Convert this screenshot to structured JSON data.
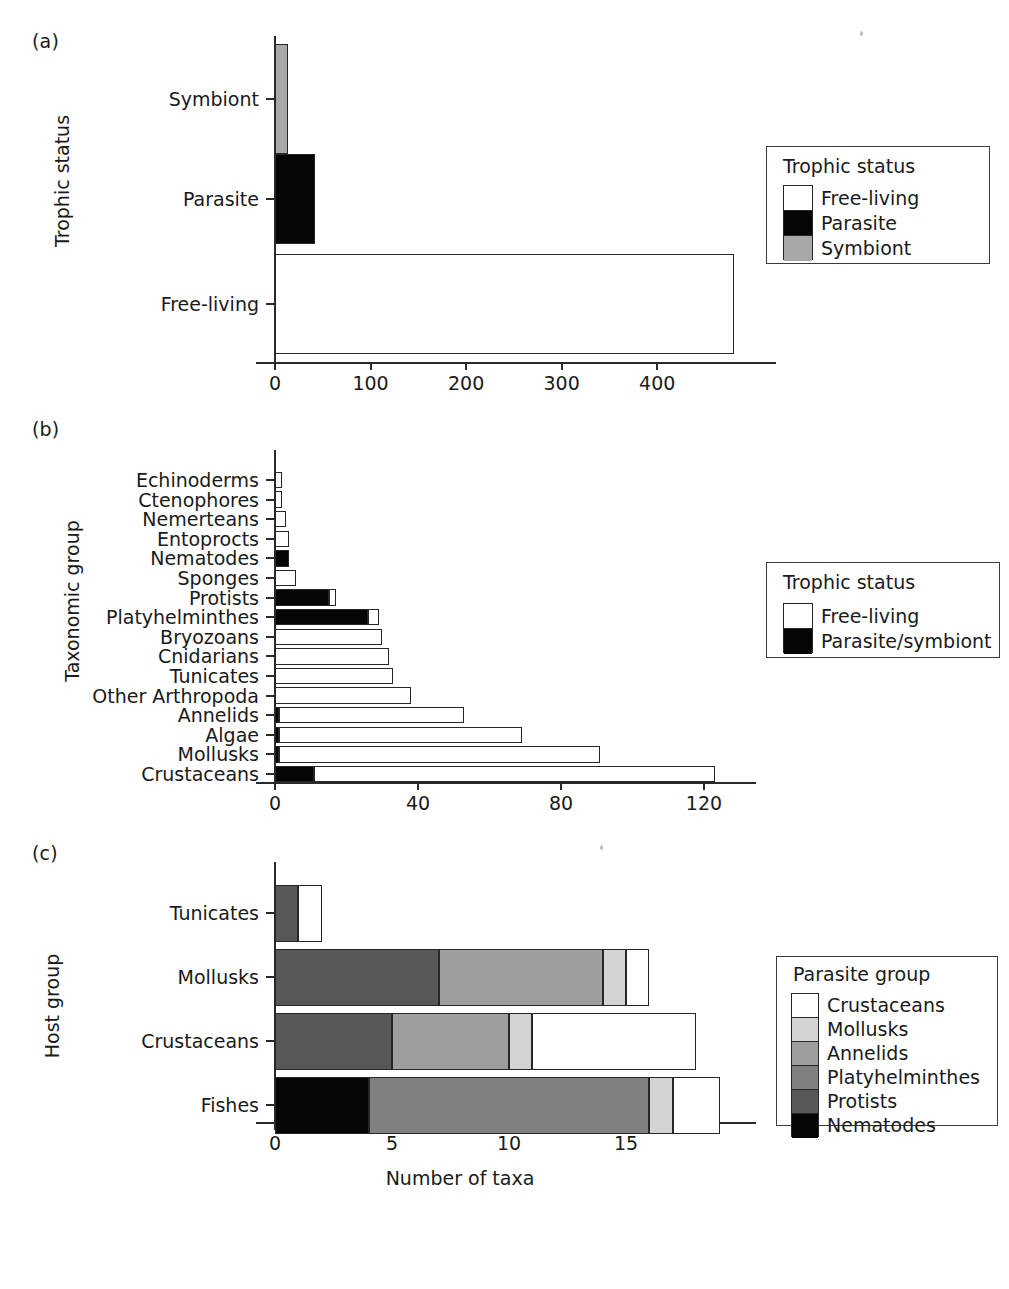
{
  "figure": {
    "panels": [
      {
        "tag": "(a)",
        "ylabel": "Trophic status",
        "xlabel": "",
        "legend": {
          "title": "Trophic status",
          "entries": [
            {
              "label": "Free-living",
              "color": "#ffffff"
            },
            {
              "label": "Parasite",
              "color": "#050505"
            },
            {
              "label": "Symbiont",
              "color": "#a8a8a8"
            }
          ]
        }
      },
      {
        "tag": "(b)",
        "ylabel": "Taxonomic group",
        "xlabel": "",
        "legend": {
          "title": "Trophic status",
          "entries": [
            {
              "label": "Free-living",
              "color": "#ffffff"
            },
            {
              "label": "Parasite/symbiont",
              "color": "#050505"
            }
          ]
        }
      },
      {
        "tag": "(c)",
        "ylabel": "Host group",
        "xlabel": "Number of taxa",
        "legend": {
          "title": "Parasite group",
          "entries": [
            {
              "label": "Crustaceans",
              "color": "#ffffff"
            },
            {
              "label": "Mollusks",
              "color": "#d4d4d4"
            },
            {
              "label": "Annelids",
              "color": "#9e9e9e"
            },
            {
              "label": "Platyhelminthes",
              "color": "#808080"
            },
            {
              "label": "Protists",
              "color": "#585858"
            },
            {
              "label": "Nematodes",
              "color": "#050505"
            }
          ]
        }
      }
    ]
  },
  "chart_data": [
    {
      "panel": "a",
      "type": "bar",
      "orientation": "horizontal",
      "title": "",
      "xlabel": "",
      "ylabel": "Trophic status",
      "categories": [
        "Free-living",
        "Parasite",
        "Symbiont"
      ],
      "values": [
        480,
        42,
        14
      ],
      "colors": [
        "#ffffff",
        "#050505",
        "#a8a8a8"
      ],
      "xlim": [
        0,
        500
      ],
      "xticks": [
        0,
        100,
        200,
        300,
        400
      ],
      "xticklabels": [
        "0",
        "100",
        "200",
        "300",
        "400"
      ],
      "grid": false,
      "legend_position": "right",
      "legend_title": "Trophic status",
      "legend_entries": [
        "Free-living",
        "Parasite",
        "Symbiont"
      ]
    },
    {
      "panel": "b",
      "type": "bar",
      "orientation": "horizontal",
      "stacked": true,
      "title": "",
      "xlabel": "",
      "ylabel": "Taxonomic group",
      "categories": [
        "Crustaceans",
        "Mollusks",
        "Algae",
        "Annelids",
        "Other Arthropoda",
        "Tunicates",
        "Cnidarians",
        "Bryozoans",
        "Platyhelminthes",
        "Protists",
        "Sponges",
        "Nematodes",
        "Entoprocts",
        "Nemerteans",
        "Ctenophores",
        "Echinoderms"
      ],
      "series": [
        {
          "name": "Parasite/symbiont",
          "color": "#050505",
          "values": [
            11,
            1,
            1,
            1,
            0,
            0,
            0,
            0,
            26,
            15,
            0,
            4,
            0,
            0,
            0,
            0
          ]
        },
        {
          "name": "Free-living",
          "color": "#ffffff",
          "values": [
            112,
            90,
            68,
            52,
            38,
            33,
            32,
            30,
            3,
            2,
            6,
            0,
            4,
            3,
            2,
            2
          ]
        }
      ],
      "totals": [
        123,
        91,
        69,
        53,
        38,
        33,
        32,
        30,
        29,
        17,
        6,
        4,
        4,
        3,
        2,
        2
      ],
      "xlim": [
        0,
        130
      ],
      "xticks": [
        0,
        40,
        80,
        120
      ],
      "xticklabels": [
        "0",
        "40",
        "80",
        "120"
      ],
      "grid": false,
      "legend_position": "right",
      "legend_title": "Trophic status",
      "legend_entries": [
        "Free-living",
        "Parasite/symbiont"
      ]
    },
    {
      "panel": "c",
      "type": "bar",
      "orientation": "horizontal",
      "stacked": true,
      "title": "",
      "xlabel": "Number of taxa",
      "ylabel": "Host group",
      "categories": [
        "Fishes",
        "Crustaceans",
        "Mollusks",
        "Tunicates"
      ],
      "series": [
        {
          "name": "Nematodes",
          "color": "#050505",
          "values": [
            4,
            0,
            0,
            0
          ]
        },
        {
          "name": "Protists",
          "color": "#585858",
          "values": [
            0,
            5,
            7,
            1
          ]
        },
        {
          "name": "Platyhelminthes",
          "color": "#808080",
          "values": [
            12,
            0,
            0,
            0
          ]
        },
        {
          "name": "Annelids",
          "color": "#9e9e9e",
          "values": [
            0,
            5,
            7,
            0
          ]
        },
        {
          "name": "Mollusks",
          "color": "#d4d4d4",
          "values": [
            1,
            1,
            1,
            0
          ]
        },
        {
          "name": "Crustaceans",
          "color": "#ffffff",
          "values": [
            2,
            7,
            1,
            1
          ]
        }
      ],
      "totals": [
        19,
        18,
        16,
        2
      ],
      "xlim": [
        0,
        19.5
      ],
      "xticks": [
        0,
        5,
        10,
        15
      ],
      "xticklabels": [
        "0",
        "5",
        "10",
        "15"
      ],
      "grid": false,
      "legend_position": "right",
      "legend_title": "Parasite group",
      "legend_entries": [
        "Crustaceans",
        "Mollusks",
        "Annelids",
        "Platyhelminthes",
        "Protists",
        "Nematodes"
      ]
    }
  ]
}
